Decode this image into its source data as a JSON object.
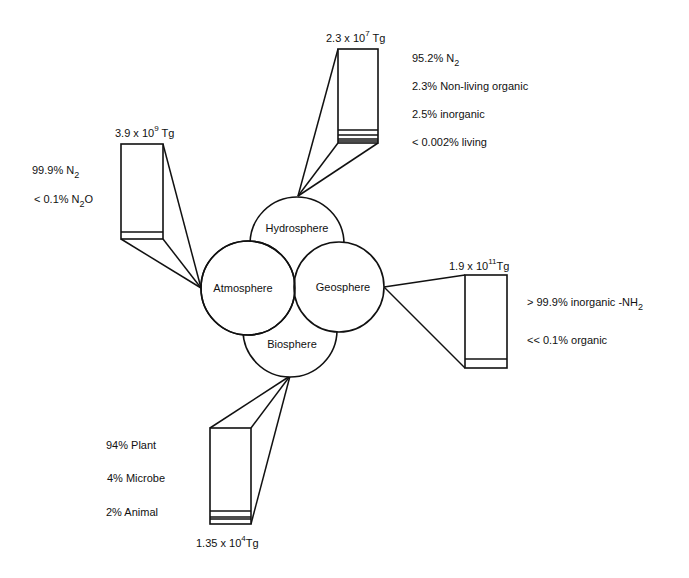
{
  "diagram": {
    "title": "",
    "colors": {
      "stroke": "#111111",
      "background": "#ffffff"
    },
    "spheres": [
      {
        "id": "hydrosphere",
        "label": "Hydrosphere",
        "cx": 297,
        "cy": 244,
        "r": 47,
        "lx": 297,
        "ly": 232
      },
      {
        "id": "atmosphere",
        "label": "Atmosphere",
        "cx": 248,
        "cy": 288,
        "r": 47,
        "lx": 243,
        "ly": 292
      },
      {
        "id": "geosphere",
        "label": "Geosphere",
        "cx": 339,
        "cy": 287,
        "r": 45,
        "lx": 343,
        "ly": 291
      },
      {
        "id": "biosphere",
        "label": "Biosphere",
        "cx": 290,
        "cy": 330,
        "r": 47,
        "lx": 292,
        "ly": 348
      }
    ],
    "reservoirs": [
      {
        "id": "hydrosphere-reservoir",
        "mass": {
          "coef": "2.3 x 10",
          "exp": "7",
          "unit": " Tg",
          "x": 326,
          "y": 42
        },
        "box": {
          "x": 338,
          "y": 49,
          "w": 40,
          "h": 94
        },
        "bands": [
          130,
          135,
          139,
          141
        ],
        "apex": {
          "x": 298,
          "y": 196
        },
        "fan": [
          [
            338,
            49
          ],
          [
            338,
            143
          ],
          [
            378,
            143
          ]
        ],
        "composition": [
          {
            "text": "95.2% N",
            "sub": "2",
            "tail": "",
            "x": 412,
            "y": 62
          },
          {
            "text": "2.3% Non-living organic",
            "sub": "",
            "tail": "",
            "x": 412,
            "y": 90
          },
          {
            "text": "2.5% inorganic",
            "sub": "",
            "tail": "",
            "x": 412,
            "y": 118
          },
          {
            "text": "< 0.002% living",
            "sub": "",
            "tail": "",
            "x": 412,
            "y": 146
          }
        ]
      },
      {
        "id": "atmosphere-reservoir",
        "mass": {
          "coef": "3.9 x 10",
          "exp": "9",
          "unit": " Tg",
          "x": 115,
          "y": 137
        },
        "box": {
          "x": 121,
          "y": 144,
          "w": 42,
          "h": 95
        },
        "bands": [
          232
        ],
        "apex": {
          "x": 201,
          "y": 288
        },
        "fan": [
          [
            121,
            239
          ],
          [
            163,
            239
          ],
          [
            163,
            144
          ]
        ],
        "composition": [
          {
            "text": "99.9% N",
            "sub": "2",
            "tail": "",
            "x": 32,
            "y": 174
          },
          {
            "text": "< 0.1% N",
            "sub": "2",
            "tail": "O",
            "x": 34,
            "y": 203
          }
        ]
      },
      {
        "id": "geosphere-reservoir",
        "mass": {
          "coef": "1.9 x 10",
          "exp": "11",
          "unit": "Tg",
          "x": 449,
          "y": 270
        },
        "box": {
          "x": 465,
          "y": 275,
          "w": 42,
          "h": 93
        },
        "bands": [
          359
        ],
        "apex": {
          "x": 384,
          "y": 287
        },
        "fan": [
          [
            465,
            275
          ],
          [
            465,
            368
          ]
        ],
        "composition": [
          {
            "text": "> 99.9% inorganic -NH",
            "sub": "2",
            "tail": "",
            "x": 527,
            "y": 306
          },
          {
            "text": "<< 0.1% organic",
            "sub": "",
            "tail": "",
            "x": 527,
            "y": 344
          }
        ]
      },
      {
        "id": "biosphere-reservoir",
        "mass": {
          "coef": "1.35 x 10",
          "exp": "4",
          "unit": "Tg",
          "x": 196,
          "y": 547
        },
        "box": {
          "x": 210,
          "y": 428,
          "w": 41,
          "h": 96
        },
        "bands": [
          511,
          517,
          519
        ],
        "apex": {
          "x": 290,
          "y": 376
        },
        "fan": [
          [
            210,
            428
          ],
          [
            251,
            428
          ],
          [
            251,
            524
          ]
        ],
        "composition": [
          {
            "text": "94% Plant",
            "sub": "",
            "tail": "",
            "x": 106,
            "y": 449
          },
          {
            "text": "4% Microbe",
            "sub": "",
            "tail": "",
            "x": 107,
            "y": 482
          },
          {
            "text": "2% Animal",
            "sub": "",
            "tail": "",
            "x": 106,
            "y": 516
          }
        ]
      }
    ]
  }
}
